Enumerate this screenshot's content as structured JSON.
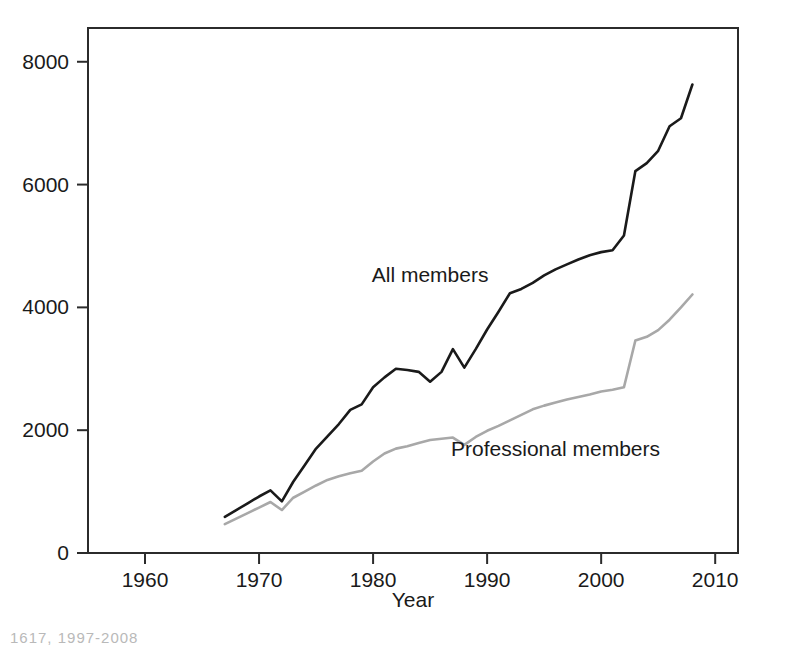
{
  "chart_data": {
    "type": "line",
    "title": "",
    "xlabel": "Year",
    "ylabel": "",
    "xlim": [
      1955,
      2012
    ],
    "ylim": [
      0,
      8550
    ],
    "grid": false,
    "legend_position": "inline-annotations",
    "xticks": [
      1960,
      1970,
      1980,
      1990,
      2000,
      2010
    ],
    "xtick_labels": [
      "1960",
      "1970",
      "1980",
      "1990",
      "2000",
      "2010"
    ],
    "yticks": [
      0,
      2000,
      4000,
      6000,
      8000
    ],
    "ytick_labels": [
      "0",
      "2000",
      "4000",
      "6000",
      "8000"
    ],
    "x": [
      1967,
      1968,
      1969,
      1970,
      1971,
      1972,
      1973,
      1974,
      1975,
      1976,
      1977,
      1978,
      1979,
      1980,
      1981,
      1982,
      1983,
      1984,
      1985,
      1986,
      1987,
      1988,
      1989,
      1990,
      1991,
      1992,
      1993,
      1994,
      1995,
      1996,
      1997,
      1998,
      1999,
      2000,
      2001,
      2002,
      2003,
      2004,
      2005,
      2006,
      2007,
      2008
    ],
    "series": [
      {
        "name": "All members",
        "color": "#1a1a1a",
        "label_x": 1985,
        "label_y": 4420,
        "values": [
          590,
          700,
          810,
          920,
          1020,
          840,
          1160,
          1430,
          1700,
          1900,
          2100,
          2330,
          2420,
          2700,
          2860,
          3000,
          2980,
          2950,
          2790,
          2950,
          3320,
          3020,
          3320,
          3640,
          3930,
          4230,
          4300,
          4400,
          4520,
          4620,
          4700,
          4780,
          4850,
          4900,
          4930,
          5170,
          6220,
          6350,
          6550,
          6950,
          7080,
          7630
        ]
      },
      {
        "name": "Professional members",
        "color": "#a8a8a8",
        "label_x": 1996,
        "label_y": 1580,
        "values": [
          470,
          560,
          650,
          740,
          830,
          700,
          900,
          1000,
          1100,
          1190,
          1250,
          1300,
          1340,
          1490,
          1620,
          1700,
          1740,
          1790,
          1840,
          1860,
          1880,
          1760,
          1890,
          1990,
          2070,
          2160,
          2250,
          2340,
          2400,
          2450,
          2500,
          2540,
          2580,
          2630,
          2660,
          2700,
          3460,
          3520,
          3630,
          3800,
          4000,
          4210
        ]
      }
    ]
  },
  "axes": {
    "x_axis_title": "Year",
    "caption": "1617, 1997-2008"
  }
}
